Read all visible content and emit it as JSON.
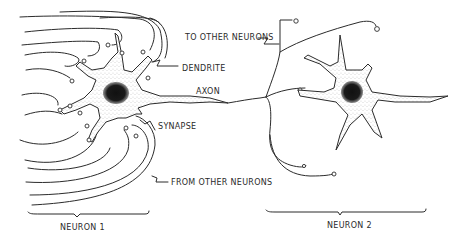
{
  "diagram": {
    "labels": {
      "to_other_neurons": "TO OTHER NEURONS",
      "dendrite": "DENDRITE",
      "axon": "AXON",
      "synapse": "SYNAPSE",
      "from_other_neurons": "FROM OTHER NEURONS",
      "neuron_1": "NEURON 1",
      "neuron_2": "NEURON 2"
    },
    "colors": {
      "ink": "#2b2b2b",
      "background": "#ffffff",
      "nucleus": "#1a1a1a"
    }
  }
}
